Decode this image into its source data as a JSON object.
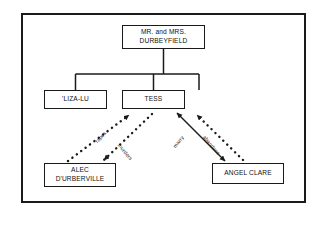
{
  "diagram": {
    "type": "relationship-tree",
    "frame_color": "#1a1a1a",
    "background_color": "#ffffff",
    "nodes": [
      {
        "id": "parents",
        "label": "MR. and MRS.\nDURBEYFIELD"
      },
      {
        "id": "lizalu",
        "label": "'LIZA-LU"
      },
      {
        "id": "tess",
        "label": "TESS"
      },
      {
        "id": "alec",
        "label": "ALEC\nD'URBERVILLE"
      },
      {
        "id": "angel",
        "label": "ANGEL CLARE"
      }
    ],
    "edges": [
      {
        "id": "parents-children",
        "from": "parents",
        "to": "lizalu,tess",
        "label": "",
        "style": "solid",
        "arrow": "none"
      },
      {
        "id": "rapes",
        "from": "alec",
        "to": "tess",
        "label": "rapes",
        "style": "dotted",
        "arrow": "to-tess"
      },
      {
        "id": "murders",
        "from": "tess",
        "to": "alec",
        "label": "murders",
        "style": "dotted",
        "arrow": "to-alec"
      },
      {
        "id": "marry",
        "from": "tess",
        "to": "angel",
        "label": "marry",
        "style": "solid",
        "arrow": "double"
      },
      {
        "id": "abandons",
        "from": "angel",
        "to": "tess",
        "label": "abandons",
        "style": "dotted",
        "arrow": "to-tess"
      }
    ]
  }
}
